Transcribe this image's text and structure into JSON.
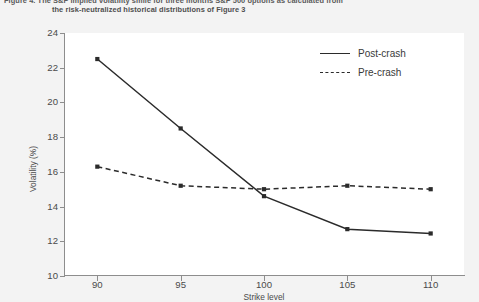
{
  "caption": {
    "line1": "Figure 4. The S&P implied volatility smile for three months S&P 500 options as calculated from",
    "line2": "the risk-neutralized historical distributions of Figure 3"
  },
  "legend": {
    "position": "top-right",
    "items": [
      {
        "label": "Post-crash",
        "style": "solid",
        "color": "#2b2b2b"
      },
      {
        "label": "Pre-crash",
        "style": "dashed",
        "color": "#2b2b2b"
      }
    ]
  },
  "axes": {
    "y_label": "Volatility (%)",
    "y_ticks": [
      "24",
      "22",
      "20",
      "18",
      "16",
      "14",
      "12",
      "10"
    ],
    "x_label": "Strike level",
    "x_ticks": [
      "90",
      "95",
      "100",
      "105",
      "110"
    ]
  },
  "chart_data": {
    "type": "line",
    "title": "Figure 4. The S&P implied volatility smile for three months S&P 500 options as calculated from the risk-neutralized historical distributions of Figure 3",
    "xlabel": "Strike level",
    "ylabel": "Volatility (%)",
    "x": [
      90,
      95,
      100,
      105,
      110
    ],
    "xlim": [
      88,
      112
    ],
    "ylim": [
      10,
      24
    ],
    "ytick_step": 2,
    "grid": false,
    "legend_position": "top-right",
    "series": [
      {
        "name": "Post-crash",
        "style": "solid",
        "color": "#2b2b2b",
        "marker": "square",
        "values": [
          22.5,
          18.5,
          14.6,
          12.7,
          12.45
        ]
      },
      {
        "name": "Pre-crash",
        "style": "dashed",
        "color": "#2b2b2b",
        "marker": "square",
        "values": [
          16.3,
          15.2,
          15.0,
          15.2,
          15.0
        ]
      }
    ]
  }
}
